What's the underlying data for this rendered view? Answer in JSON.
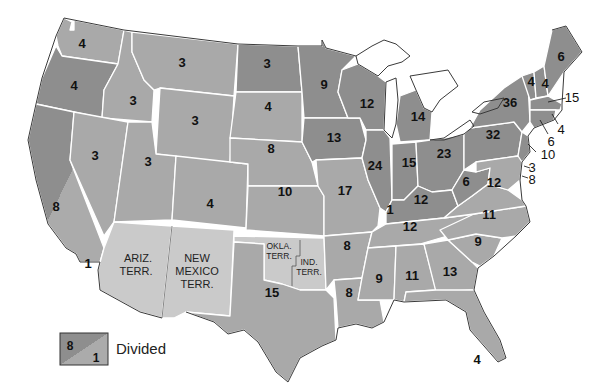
{
  "map": {
    "subject": "Electoral votes by state (U.S. map with territories)",
    "colors": {
      "dark": "#8e8e8e",
      "medium": "#a9a9a9",
      "territory": "#cacaca",
      "border": "#ffffff",
      "coast": "#3a3a3a",
      "water": "#ffffff"
    },
    "states": [
      {
        "name": "Washington",
        "votes": "4",
        "shade": "medium"
      },
      {
        "name": "Oregon",
        "votes": "4",
        "shade": "dark"
      },
      {
        "name": "California",
        "votes": "8",
        "divided_votes": "1",
        "shade": "divided"
      },
      {
        "name": "Idaho",
        "votes": "3",
        "shade": "medium"
      },
      {
        "name": "Nevada",
        "votes": "3",
        "shade": "medium"
      },
      {
        "name": "Montana",
        "votes": "3",
        "shade": "medium"
      },
      {
        "name": "Wyoming",
        "votes": "3",
        "shade": "medium"
      },
      {
        "name": "Utah",
        "votes": "3",
        "shade": "medium"
      },
      {
        "name": "Colorado",
        "votes": "4",
        "shade": "medium"
      },
      {
        "name": "North Dakota",
        "votes": "3",
        "shade": "dark"
      },
      {
        "name": "South Dakota",
        "votes": "4",
        "shade": "medium"
      },
      {
        "name": "Nebraska",
        "votes": "8",
        "shade": "medium"
      },
      {
        "name": "Kansas",
        "votes": "10",
        "shade": "medium"
      },
      {
        "name": "Texas",
        "votes": "15",
        "shade": "medium"
      },
      {
        "name": "Minnesota",
        "votes": "9",
        "shade": "dark"
      },
      {
        "name": "Iowa",
        "votes": "13",
        "shade": "dark"
      },
      {
        "name": "Missouri",
        "votes": "17",
        "shade": "medium"
      },
      {
        "name": "Arkansas",
        "votes": "8",
        "shade": "medium"
      },
      {
        "name": "Louisiana",
        "votes": "8",
        "shade": "medium"
      },
      {
        "name": "Wisconsin",
        "votes": "12",
        "shade": "dark"
      },
      {
        "name": "Illinois",
        "votes": "24",
        "shade": "dark"
      },
      {
        "name": "Michigan",
        "votes": "14",
        "shade": "dark"
      },
      {
        "name": "Indiana",
        "votes": "15",
        "shade": "dark"
      },
      {
        "name": "Ohio",
        "votes": "23",
        "shade": "dark"
      },
      {
        "name": "Kentucky",
        "votes": "12",
        "divided_votes": "1",
        "shade": "dark"
      },
      {
        "name": "Tennessee",
        "votes": "12",
        "shade": "medium"
      },
      {
        "name": "Mississippi",
        "votes": "9",
        "shade": "medium"
      },
      {
        "name": "Alabama",
        "votes": "11",
        "shade": "medium"
      },
      {
        "name": "Georgia",
        "votes": "13",
        "shade": "medium"
      },
      {
        "name": "Florida",
        "votes": "4",
        "shade": "medium"
      },
      {
        "name": "South Carolina",
        "votes": "9",
        "shade": "medium"
      },
      {
        "name": "North Carolina",
        "votes": "11",
        "shade": "medium"
      },
      {
        "name": "Virginia",
        "votes": "12",
        "shade": "medium"
      },
      {
        "name": "West Virginia",
        "votes": "6",
        "shade": "dark"
      },
      {
        "name": "Pennsylvania",
        "votes": "32",
        "shade": "dark"
      },
      {
        "name": "New York",
        "votes": "36",
        "shade": "dark"
      },
      {
        "name": "Vermont",
        "votes": "4",
        "shade": "dark"
      },
      {
        "name": "New Hampshire",
        "votes": "4",
        "shade": "dark"
      },
      {
        "name": "Maine",
        "votes": "6",
        "shade": "dark"
      },
      {
        "name": "Massachusetts",
        "votes": "15",
        "shade": "dark"
      },
      {
        "name": "Rhode Island",
        "votes": "4",
        "shade": "dark"
      },
      {
        "name": "Connecticut",
        "votes": "6",
        "shade": "dark"
      },
      {
        "name": "New Jersey",
        "votes": "10",
        "shade": "dark"
      },
      {
        "name": "Delaware",
        "votes": "3",
        "shade": "medium"
      },
      {
        "name": "Maryland",
        "votes": "8",
        "shade": "medium"
      }
    ],
    "territories": {
      "arizona": {
        "line1": "ARIZ.",
        "line2": "TERR."
      },
      "new_mexico": {
        "line1": "NEW",
        "line2": "MEXICO",
        "line3": "TERR."
      },
      "oklahoma": {
        "line1": "OKLA.",
        "line2": "TERR."
      },
      "indian": {
        "line1": "IND.",
        "line2": "TERR."
      }
    }
  },
  "legend": {
    "swatch_top": "8",
    "swatch_bottom": "1",
    "label": "Divided"
  }
}
